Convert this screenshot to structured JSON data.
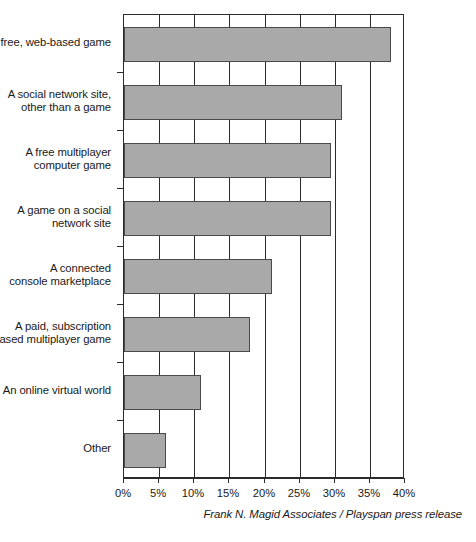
{
  "attribution": "Frank N. Magid Associates / Playspan press release",
  "axis": {
    "tick_labels": [
      "0%",
      "5%",
      "10%",
      "15%",
      "20%",
      "25%",
      "30%",
      "35%",
      "40%"
    ]
  },
  "colors": {
    "bar_fill": "#a9a9a9",
    "bar_border": "#4a4a4a",
    "axis": "#2b2b2b",
    "text": "#1a1a1a",
    "background": "#ffffff"
  },
  "chart_data": {
    "type": "bar",
    "orientation": "horizontal",
    "title": "",
    "subtitle": "",
    "xlabel": "",
    "ylabel": "",
    "xlim": [
      0,
      40
    ],
    "ylim": null,
    "grid": true,
    "legend": null,
    "xtick_labels": [
      "0%",
      "5%",
      "10%",
      "15%",
      "20%",
      "25%",
      "30%",
      "35%",
      "40%"
    ],
    "xticks": [
      0,
      5,
      10,
      15,
      20,
      25,
      30,
      35,
      40
    ],
    "categories": [
      "A free, web-based game",
      "A social network site, other than a game",
      "A free multiplayer computer game",
      "A game on a social network site",
      "A connected console marketplace",
      "A paid, subscription based multiplayer game",
      "An online virtual world",
      "Other"
    ],
    "category_lines": [
      [
        "A free, web-based game"
      ],
      [
        "A social network site,",
        "other than a game"
      ],
      [
        "A free multiplayer",
        "computer game"
      ],
      [
        "A game on a social",
        "network site"
      ],
      [
        "A connected",
        "console marketplace"
      ],
      [
        "A paid, subscription",
        "based multiplayer game"
      ],
      [
        "An online virtual world"
      ],
      [
        "Other"
      ]
    ],
    "values": [
      38,
      31,
      29.5,
      29.5,
      21,
      18,
      11,
      6
    ],
    "value_labels": [
      "38%",
      "31%",
      "29.5%",
      "29.5%",
      "21%",
      "18%",
      "11%",
      "6%"
    ],
    "annotations": [
      "Frank N. Magid Associates / Playspan press release"
    ]
  }
}
